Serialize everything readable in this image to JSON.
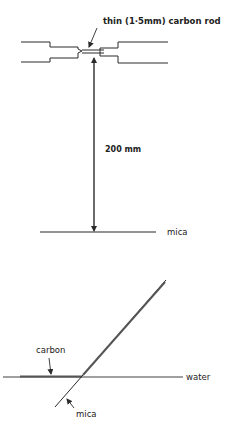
{
  "figure": {
    "top_panel": {
      "rod_label": "thin (1·5mm) carbon rod",
      "distance_label": "200 mm",
      "mica_label": "mica"
    },
    "bottom_panel": {
      "carbon_label": "carbon",
      "water_label": "water",
      "mica_label": "mica"
    },
    "colors": {
      "line": "#2a2a2a",
      "background": "#ffffff"
    }
  }
}
